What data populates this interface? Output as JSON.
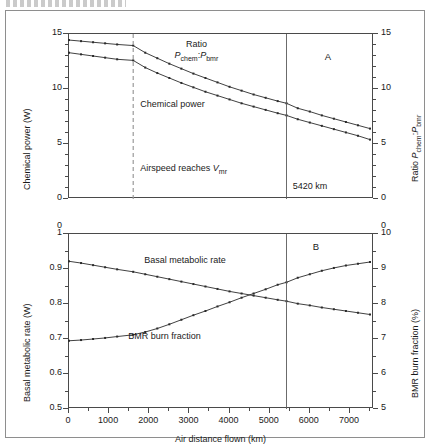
{
  "figure": {
    "header_fragment": "",
    "panelA_letter": "A",
    "panelB_letter": "B",
    "xlabel": "Air distance flown (km)"
  },
  "panelA": {
    "ylabel_left": "Chemical power (W)",
    "ylabel_right_pre": "Ratio ",
    "ylabel_right_P1": "P",
    "ylabel_right_sub1": "chem",
    "ylabel_right_sep": ":",
    "ylabel_right_P2": "P",
    "ylabel_right_sub2": "bmr",
    "yticks_left": [
      "0",
      "5",
      "10",
      "15"
    ],
    "yticks_right": [
      "0",
      "5",
      "10",
      "15"
    ],
    "ann_ratio_line1": "Ratio",
    "ann_ratio_P1": "P",
    "ann_ratio_sub1": "chem",
    "ann_ratio_sep": ":",
    "ann_ratio_P2": "P",
    "ann_ratio_sub2": "bmr",
    "ann_chemical": "Chemical power",
    "ann_airspeed_pre": "Airspeed reaches ",
    "ann_airspeed_V": "V",
    "ann_airspeed_sub": "mr",
    "ann_distance": "5420 km"
  },
  "panelB": {
    "ylabel_left": "Basal metabolic rate (W)",
    "ylabel_right": "BMR burn fraction (%)",
    "yticks_left": [
      "0.5",
      "0.6",
      "0.7",
      "0.8",
      "0.9",
      "1",
      "0"
    ],
    "yticks_right": [
      "5",
      "6",
      "7",
      "8",
      "9",
      "10",
      "0"
    ],
    "ann_bmr": "Basal metabolic rate",
    "ann_burn": "BMR burn fraction"
  },
  "xticks": [
    "0",
    "1000",
    "2000",
    "3000",
    "4000",
    "5000",
    "6000",
    "7000"
  ],
  "markers": {
    "vmr_distance": 1600,
    "solid_distance": 5420
  },
  "chart_data": [
    {
      "type": "line",
      "panel": "A",
      "title": "",
      "xlabel": "Air distance flown (km)",
      "ylabel": "Chemical power (W)",
      "ylabel_right": "Ratio Pchem:Pbmr",
      "xlim": [
        0,
        7600
      ],
      "ylim": [
        0,
        15
      ],
      "ylim_right": [
        0,
        15
      ],
      "grid": false,
      "vertical_markers": [
        {
          "x": 1600,
          "style": "dashed",
          "label": "Airspeed reaches Vmr"
        },
        {
          "x": 5420,
          "style": "solid",
          "label": "5420 km"
        }
      ],
      "series": [
        {
          "name": "Ratio Pchem:Pbmr",
          "axis": "right",
          "x": [
            0,
            300,
            600,
            900,
            1200,
            1600,
            1900,
            2200,
            2500,
            2800,
            3100,
            3400,
            3700,
            4000,
            4300,
            4600,
            4900,
            5200,
            5420,
            5700,
            6000,
            6300,
            6600,
            6900,
            7200,
            7500
          ],
          "values": [
            14.45,
            14.35,
            14.25,
            14.15,
            14.05,
            13.95,
            13.3,
            12.8,
            12.3,
            11.85,
            11.4,
            11.0,
            10.6,
            10.2,
            9.85,
            9.5,
            9.2,
            8.9,
            8.7,
            8.25,
            7.95,
            7.6,
            7.3,
            7.0,
            6.7,
            6.4
          ]
        },
        {
          "name": "Chemical power",
          "axis": "left",
          "x": [
            0,
            300,
            600,
            900,
            1200,
            1600,
            1900,
            2200,
            2500,
            2800,
            3100,
            3400,
            3700,
            4000,
            4300,
            4600,
            4900,
            5200,
            5420,
            5700,
            6000,
            6300,
            6600,
            6900,
            7200,
            7500
          ],
          "values": [
            13.3,
            13.15,
            13.0,
            12.85,
            12.7,
            12.6,
            11.95,
            11.45,
            11.0,
            10.55,
            10.15,
            9.75,
            9.4,
            9.05,
            8.7,
            8.4,
            8.1,
            7.8,
            7.6,
            7.25,
            6.95,
            6.65,
            6.35,
            6.05,
            5.75,
            5.4
          ]
        }
      ]
    },
    {
      "type": "line",
      "panel": "B",
      "title": "",
      "xlabel": "Air distance flown (km)",
      "ylabel": "Basal metabolic rate (W)",
      "ylabel_right": "BMR burn fraction (%)",
      "xlim": [
        0,
        7600
      ],
      "ylim": [
        0.5,
        1.0
      ],
      "ylim_right": [
        5,
        10
      ],
      "grid": false,
      "vertical_markers": [
        {
          "x": 5420,
          "style": "solid",
          "label": ""
        }
      ],
      "series": [
        {
          "name": "Basal metabolic rate",
          "axis": "left",
          "x": [
            0,
            300,
            600,
            900,
            1200,
            1600,
            1900,
            2200,
            2500,
            2800,
            3100,
            3400,
            3700,
            4000,
            4300,
            4600,
            4900,
            5200,
            5420,
            5700,
            6000,
            6300,
            6600,
            6900,
            7200,
            7500
          ],
          "values": [
            0.922,
            0.917,
            0.911,
            0.905,
            0.899,
            0.892,
            0.885,
            0.878,
            0.871,
            0.864,
            0.857,
            0.85,
            0.843,
            0.836,
            0.83,
            0.824,
            0.818,
            0.812,
            0.808,
            0.801,
            0.796,
            0.79,
            0.785,
            0.78,
            0.775,
            0.77
          ]
        },
        {
          "name": "BMR burn fraction",
          "axis": "right",
          "x": [
            0,
            300,
            600,
            900,
            1200,
            1600,
            1900,
            2200,
            2500,
            2800,
            3100,
            3400,
            3700,
            4000,
            4300,
            4600,
            4900,
            5200,
            5420,
            5700,
            6000,
            6300,
            6600,
            6900,
            7200,
            7500
          ],
          "values": [
            6.95,
            6.97,
            7.0,
            7.03,
            7.07,
            7.12,
            7.2,
            7.3,
            7.42,
            7.55,
            7.68,
            7.8,
            7.93,
            8.05,
            8.18,
            8.3,
            8.42,
            8.55,
            8.62,
            8.75,
            8.85,
            8.95,
            9.03,
            9.1,
            9.15,
            9.2
          ]
        }
      ]
    }
  ]
}
